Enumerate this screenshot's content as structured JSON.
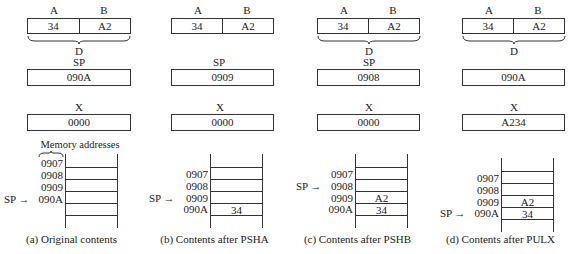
{
  "panels": [
    {
      "id": "a",
      "register_labels": {
        "a": "A",
        "b": "B",
        "d": "D"
      },
      "registers": {
        "a": "34",
        "b": "A2"
      },
      "show_brace": true,
      "sp_label": "SP",
      "sp_value": "090A",
      "x_label": "X",
      "x_value": "0000",
      "memory_label": "Memory addresses",
      "addresses": [
        "0907",
        "0908",
        "0909",
        "090A"
      ],
      "stack_values": [
        "",
        "",
        "",
        ""
      ],
      "sp_pointer_index": 3,
      "sp_pointer_text": "SP →",
      "caption": "(a) Original contents"
    },
    {
      "id": "b",
      "register_labels": {
        "a": "A",
        "b": "B"
      },
      "registers": {
        "a": "34",
        "b": "A2"
      },
      "show_brace": false,
      "sp_label": "SP",
      "sp_value": "0909",
      "x_label": "X",
      "x_value": "0000",
      "addresses": [
        "0907",
        "0908",
        "0909",
        "090A"
      ],
      "stack_values": [
        "",
        "",
        "",
        "34"
      ],
      "sp_pointer_index": 2,
      "sp_pointer_text": "SP →",
      "caption": "(b) Contents after PSHA"
    },
    {
      "id": "c",
      "register_labels": {
        "a": "A",
        "b": "B",
        "d": "D"
      },
      "registers": {
        "a": "34",
        "b": "A2"
      },
      "show_brace": true,
      "sp_label": "SP",
      "sp_value": "0908",
      "x_label": "X",
      "x_value": "0000",
      "addresses": [
        "0907",
        "0908",
        "0909",
        "090A"
      ],
      "stack_values": [
        "",
        "",
        "A2",
        "34"
      ],
      "sp_pointer_index": 1,
      "sp_pointer_text": "SP →",
      "caption": "(c) Contents after PSHB"
    },
    {
      "id": "d",
      "register_labels": {
        "a": "A",
        "b": "B",
        "d": "D"
      },
      "registers": {
        "a": "34",
        "b": "A2"
      },
      "show_brace": true,
      "sp_value": "090A",
      "x_label": "X",
      "x_value": "A234",
      "addresses": [
        "0907",
        "0908",
        "0909",
        "090A"
      ],
      "stack_values": [
        "",
        "",
        "A2",
        "34"
      ],
      "sp_pointer_index": 3,
      "sp_pointer_text": "SP →",
      "caption": "(d) Contents after PULX"
    }
  ]
}
